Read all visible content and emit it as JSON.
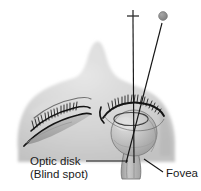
{
  "figure": {
    "title_fragment": "",
    "background_color": "#ffffff",
    "width": 201,
    "height": 191
  },
  "colors": {
    "head_silhouette": "#d2d2d2",
    "head_silhouette_light": "#e3e3e3",
    "head_silhouette_shadow": "#bdbdbd",
    "eyeball_fill": "#c0c0c0",
    "eyeball_highlight": "#e0e0e0",
    "eyeball_shadow": "#9a9a9a",
    "optic_nerve": "#b0b0b0",
    "stimulus_dot": "#8c8c8c",
    "line_stroke": "#1a1a1a",
    "text": "#1a1a1a"
  },
  "stimuli": {
    "fixation_cross": {
      "name": "plus",
      "glyph": "+",
      "x": 133,
      "y": 16
    },
    "target_dot": {
      "name": "gray-dot",
      "x": 163,
      "y": 16,
      "radius": 4.2
    }
  },
  "rays": [
    {
      "name": "fixation-ray",
      "from_x": 133,
      "from_y": 24,
      "to_x": 134,
      "to_y": 162
    },
    {
      "name": "target-ray",
      "from_x": 162,
      "from_y": 24,
      "to_x": 126,
      "to_y": 162
    }
  ],
  "anatomy": {
    "right_eye": {
      "name": "open-eye-sphere",
      "cx": 134,
      "cy": 133,
      "rx": 23,
      "ry": 23
    },
    "left_eye": {
      "name": "covered-eye"
    },
    "optic_nerve": {
      "name": "optic-nerve-stalk"
    }
  },
  "labels": {
    "optic_disk": {
      "line1": "Optic disk",
      "line2": "(Blind spot)",
      "x": 30,
      "y": 163
    },
    "fovea": {
      "text": "Fovea",
      "x": 166,
      "y": 175
    }
  },
  "leaders": {
    "optic_disk_leader": {
      "x1": 86,
      "y1": 161,
      "x2": 128,
      "y2": 161
    },
    "fovea_leader": {
      "x1": 163,
      "y1": 172,
      "x2": 144,
      "y2": 159
    }
  }
}
